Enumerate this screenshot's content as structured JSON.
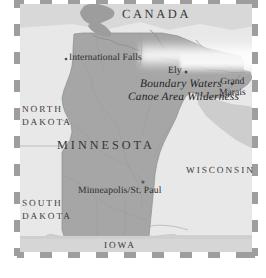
{
  "map": {
    "title": "Minnesota and the Boundary Waters Canoe Area Wilderness",
    "style": "grayscale reference map",
    "colors": {
      "state_fill": "#a6a6a6",
      "neighbor_fill": "#e6e6e6",
      "water_fill": "#cfcfcf",
      "water_highlight": "#ffffff",
      "outline": "#8a8a8a",
      "border_dash_dark": "#9a9a9a",
      "border_dash_light": "#ffffff",
      "label_text": "#2e2e2e",
      "page_background": "#ffffff"
    },
    "border": {
      "style": "dashed-frame",
      "label": "decorative dashed map frame"
    },
    "labels": {
      "canada": "CANADA",
      "north_dakota_line1": "NORTH",
      "north_dakota_line2": "DAKOTA",
      "south_dakota_line1": "SOUTH",
      "south_dakota_line2": "DAKOTA",
      "minnesota": "MINNESOTA",
      "wisconsin": "WISCONSIN",
      "iowa": "IOWA",
      "international_falls": "International Falls",
      "ely": "Ely",
      "grand_marais_line1": "Grand",
      "grand_marais_line2": "Marais",
      "minneapolis_st_paul": "Minneapolis/St. Paul",
      "bwcaw_line1": "Boundary Waters",
      "bwcaw_line2": "Canoe Area Wilderness"
    }
  }
}
